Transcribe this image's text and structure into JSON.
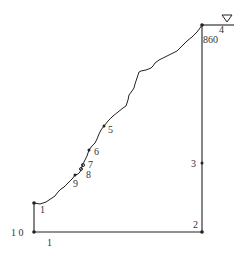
{
  "diagram": {
    "type": "slope-cross-section",
    "colors": {
      "line": "#222222",
      "node": "#222222",
      "label": "#333333",
      "background": "#ffffff"
    },
    "water_table_symbol": "inverted-triangle",
    "elevation_label": "860",
    "bottom_boundary_label": "1",
    "nodes": [
      {
        "id": "10",
        "label": "1 0",
        "x": 34,
        "y": 232
      },
      {
        "id": "1",
        "label": "1",
        "x": 34,
        "y": 203
      },
      {
        "id": "9",
        "label": "9",
        "x": 75,
        "y": 175
      },
      {
        "id": "8",
        "label": "8",
        "x": 81,
        "y": 169
      },
      {
        "id": "7",
        "label": "7",
        "x": 83,
        "y": 164
      },
      {
        "id": "6",
        "label": "6",
        "x": 89,
        "y": 150
      },
      {
        "id": "5",
        "label": "5",
        "x": 104,
        "y": 126
      },
      {
        "id": "4",
        "label": "4",
        "x": 202,
        "y": 25
      },
      {
        "id": "3",
        "label": "3",
        "x": 202,
        "y": 163
      },
      {
        "id": "2",
        "label": "2",
        "x": 202,
        "y": 232
      }
    ]
  }
}
